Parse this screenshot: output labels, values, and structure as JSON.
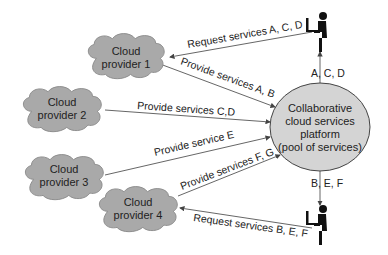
{
  "diagram": {
    "platform": {
      "lines": [
        "Collaborative",
        "cloud services",
        "platform",
        "(pool of services)"
      ]
    },
    "providers": [
      {
        "lines": [
          "Cloud",
          "provider 1"
        ]
      },
      {
        "lines": [
          "Cloud",
          "provider 2"
        ]
      },
      {
        "lines": [
          "Cloud",
          "provider 3"
        ]
      },
      {
        "lines": [
          "Cloud",
          "provider 4"
        ]
      }
    ],
    "edges": {
      "request_top": "Request services A, C, D",
      "provide_1": "Provide services A, B",
      "provide_2": "Provide services C,D",
      "provide_3": "Provide service E",
      "provide_4": "Provide services F, G",
      "request_bottom": "Request services B, E, F",
      "deliver_top": "A, C, D",
      "deliver_bottom": "B, E, F"
    },
    "users": [
      {
        "name": "user-top"
      },
      {
        "name": "user-bottom"
      }
    ],
    "colors": {
      "cloud_fill": "#a9a9a9",
      "platform_fill": "#d4d4d4",
      "line": "#555555"
    }
  }
}
